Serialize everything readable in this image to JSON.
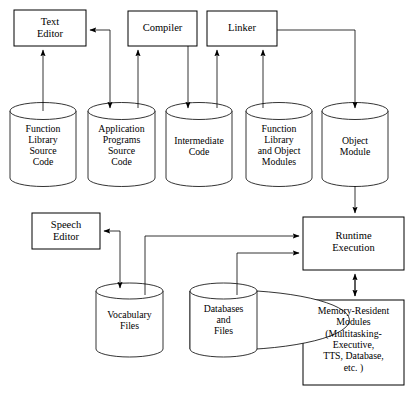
{
  "diagram": {
    "colors": {
      "stroke": "#000000",
      "fill": "#ffffff",
      "text": "#000000"
    },
    "boxes": [
      {
        "id": "text-editor",
        "label": "Text\nEditor",
        "x": 14,
        "y": 10,
        "w": 72,
        "h": 36
      },
      {
        "id": "compiler",
        "label": "Compiler",
        "x": 128,
        "y": 11,
        "w": 69,
        "h": 35
      },
      {
        "id": "linker",
        "label": "Linker",
        "x": 207,
        "y": 11,
        "w": 70,
        "h": 35
      },
      {
        "id": "speech-editor",
        "label": "Speech\nEditor",
        "x": 32,
        "y": 213,
        "w": 68,
        "h": 36
      },
      {
        "id": "runtime-execution",
        "label": "Runtime\nExecution",
        "x": 303,
        "y": 217,
        "w": 101,
        "h": 53
      },
      {
        "id": "memory-resident",
        "label": "Memory-Resident\nModules\n(Multitasking-\nExecutive,\nTTS, Database,\netc. )",
        "x": 303,
        "y": 300,
        "w": 101,
        "h": 85
      }
    ],
    "cylinders": [
      {
        "id": "function-library-source-code",
        "label": "Function\nLibrary\nSource\nCode",
        "x": 10,
        "y": 103,
        "w": 66,
        "h": 83
      },
      {
        "id": "application-programs-source-code",
        "label": "Application\nPrograms\nSource\nCode",
        "x": 88,
        "y": 103,
        "w": 67,
        "h": 83
      },
      {
        "id": "intermediate-code",
        "label": "Intermediate\nCode",
        "x": 166,
        "y": 103,
        "w": 66,
        "h": 83
      },
      {
        "id": "function-library-object-modules",
        "label": "Function\nLibrary\nand Object\nModules",
        "x": 246,
        "y": 103,
        "w": 66,
        "h": 83
      },
      {
        "id": "object-module",
        "label": "Object\nModule",
        "x": 322,
        "y": 103,
        "w": 66,
        "h": 83
      },
      {
        "id": "vocabulary-files",
        "label": "Vocabulary\nFiles",
        "x": 96,
        "y": 283,
        "w": 67,
        "h": 74
      },
      {
        "id": "databases-and-files",
        "label": "Databases\nand\nFiles",
        "x": 190,
        "y": 283,
        "w": 67,
        "h": 74
      }
    ],
    "connectors": [
      {
        "id": "funclib-src-to-text-editor",
        "from": "function-library-source-code",
        "to": "text-editor"
      },
      {
        "id": "text-editor-from-appsrc-branch",
        "from": "app-programs-branch",
        "to": "text-editor"
      },
      {
        "id": "appsrc-to-compiler",
        "from": "application-programs-source-code",
        "to": "compiler"
      },
      {
        "id": "compiler-to-intermediate",
        "from": "compiler",
        "to": "intermediate-code"
      },
      {
        "id": "intermediate-to-linker",
        "from": "intermediate-code",
        "to": "linker"
      },
      {
        "id": "funclib-objmod-to-linker",
        "from": "function-library-object-modules",
        "to": "linker"
      },
      {
        "id": "linker-to-object-module",
        "from": "linker",
        "to": "object-module"
      },
      {
        "id": "object-module-to-runtime",
        "from": "object-module",
        "to": "runtime-execution"
      },
      {
        "id": "vocabulary-to-speech-editor",
        "from": "vocabulary-branch",
        "to": "speech-editor"
      },
      {
        "id": "vocabulary-to-runtime",
        "from": "vocabulary-files",
        "to": "runtime-execution"
      },
      {
        "id": "databases-to-runtime",
        "from": "databases-and-files",
        "to": "runtime-execution"
      },
      {
        "id": "runtime-memory-bidirectional",
        "from": "runtime-execution",
        "to": "memory-resident",
        "bidirectional": true
      }
    ]
  }
}
